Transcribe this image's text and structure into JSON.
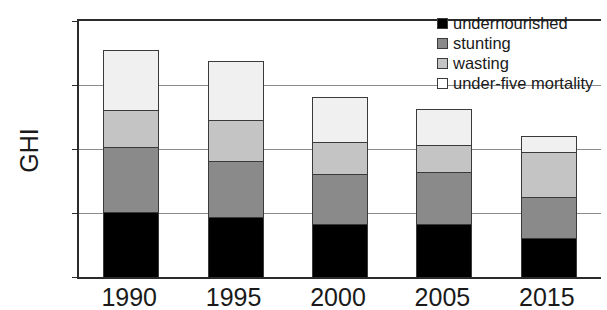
{
  "chart_data": {
    "type": "bar",
    "stacked": true,
    "title": "",
    "xlabel": "",
    "ylabel": "GHI",
    "ylim": [
      0,
      40
    ],
    "yticks": [
      0,
      10,
      20,
      30,
      40
    ],
    "grid": true,
    "legend_position": "top-right",
    "categories": [
      "1990",
      "1995",
      "2000",
      "2005",
      "2015"
    ],
    "series": [
      {
        "name": "undernourished",
        "color": "#000000",
        "values": [
          10.0,
          9.3,
          8.1,
          8.2,
          6.0
        ]
      },
      {
        "name": "stunting",
        "color": "#8a8a8a",
        "values": [
          10.2,
          8.8,
          7.9,
          8.2,
          6.5
        ]
      },
      {
        "name": "wasting",
        "color": "#c4c4c4",
        "values": [
          5.9,
          6.4,
          5.1,
          4.2,
          7.0
        ]
      },
      {
        "name": "under-five mortality",
        "color": "#f0f0f0",
        "values": [
          9.4,
          9.2,
          7.0,
          5.6,
          2.5
        ]
      }
    ],
    "totals": [
      35.5,
      33.7,
      28.1,
      26.2,
      22.0
    ]
  },
  "axes": {
    "y_title": "GHI",
    "y_tick_labels": [
      "0",
      "10",
      "20",
      "30",
      "40"
    ],
    "x_tick_labels": [
      "1990",
      "1995",
      "2000",
      "2005",
      "2015"
    ]
  },
  "legend": {
    "items": [
      {
        "label": "undernourished",
        "swatch": "legend-swatch-undernourished"
      },
      {
        "label": "stunting",
        "swatch": "legend-swatch-stunting"
      },
      {
        "label": "wasting",
        "swatch": "legend-swatch-wasting"
      },
      {
        "label": "under-five mortality",
        "swatch": "legend-swatch-mortality"
      }
    ]
  }
}
